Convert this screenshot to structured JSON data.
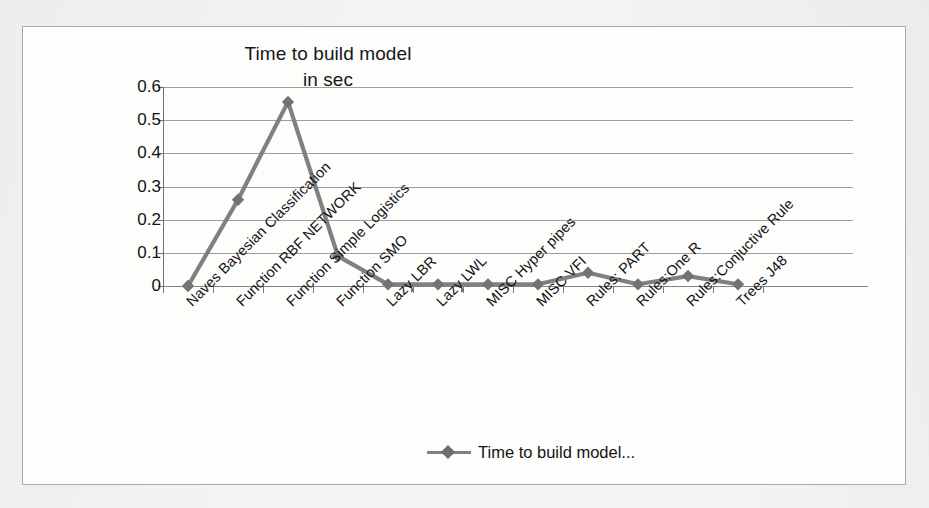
{
  "chart_data": {
    "type": "line",
    "title": "Time to build model in sec",
    "title_line1": "Time to build model",
    "title_line2": "in sec",
    "xlabel": "",
    "ylabel": "",
    "ylim": [
      0,
      0.6
    ],
    "ytick_labels": [
      "0.6",
      "0.5",
      "0.4",
      "0.3",
      "0.2",
      "0.1",
      "0"
    ],
    "ytick_values": [
      0.6,
      0.5,
      0.4,
      0.3,
      0.2,
      0.1,
      0
    ],
    "grid": true,
    "legend_position": "bottom",
    "series_color": "#808080",
    "marker": "diamond",
    "categories": [
      "Naves Bayesian Classification",
      "Function RBF NETWORK",
      "Function Simple Logistics",
      "Function SMO",
      "Lazy LBR",
      "Lazy LWL",
      "MISC  Hyper pipes",
      "MISC VFI",
      "Rules: PART",
      "Rules:One R",
      "Rules:Conjuctive Rule",
      "Trees J48"
    ],
    "series": [
      {
        "name": "Time to build model...",
        "values": [
          0.0,
          0.26,
          0.555,
          0.09,
          0.005,
          0.005,
          0.005,
          0.005,
          0.04,
          0.005,
          0.03,
          0.005
        ]
      }
    ]
  },
  "legend": {
    "entries": [
      {
        "label": "Time to build model...",
        "marker": "diamond-line-marker"
      }
    ]
  }
}
